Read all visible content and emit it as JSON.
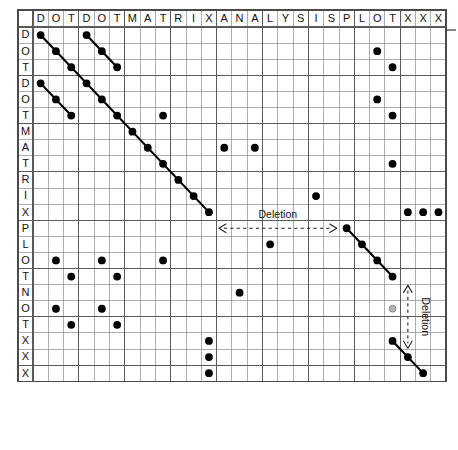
{
  "figure": {
    "grid": {
      "x0": 18,
      "y0": 10,
      "header_height": 17,
      "row_label_width": 15,
      "cell_w": 15.3,
      "cell_h": 16.1,
      "n_cols": 26,
      "n_rows": 24
    },
    "edge_tick": {
      "x1": 446,
      "x2": 456,
      "y": 30
    }
  },
  "colors": {
    "dot": "#000000",
    "dot_faded": "#b4b4b4",
    "grid_minor": "#8c8c8c",
    "grid_major": "#5a5a5a",
    "diagonal": "#000000",
    "text": "#101010"
  },
  "axes": {
    "column_sequence_label": "DOTDOTMATRIXANALYSISPLOTXXX",
    "row_sequence_label": "DOTDOTMATRIXPLOTNOTXXX",
    "columns": [
      "D",
      "O",
      "T",
      "D",
      "O",
      "T",
      "M",
      "A",
      "T",
      "R",
      "I",
      "X",
      "A",
      "N",
      "A",
      "L",
      "Y",
      "S",
      "I",
      "S",
      "P",
      "L",
      "O",
      "T",
      "X",
      "X",
      "X"
    ],
    "rows": [
      "D",
      "O",
      "T",
      "D",
      "O",
      "T",
      "M",
      "A",
      "T",
      "R",
      "I",
      "X",
      "P",
      "L",
      "O",
      "T",
      "N",
      "O",
      "T",
      "X",
      "X",
      "X"
    ]
  },
  "chart_data": {
    "type": "scatter",
    "xlabel": "",
    "ylabel": "",
    "x_categories": [
      "D",
      "O",
      "T",
      "D",
      "O",
      "T",
      "M",
      "A",
      "T",
      "R",
      "I",
      "X",
      "A",
      "N",
      "A",
      "L",
      "Y",
      "S",
      "I",
      "S",
      "P",
      "L",
      "O",
      "T",
      "X",
      "X",
      "X"
    ],
    "y_categories": [
      "D",
      "O",
      "T",
      "D",
      "O",
      "T",
      "M",
      "A",
      "T",
      "R",
      "I",
      "X",
      "P",
      "L",
      "O",
      "T",
      "N",
      "O",
      "T",
      "X",
      "X",
      "X"
    ],
    "grid": true,
    "legend": "none",
    "note": "Matches between row sequence and column sequence; col/row indices are 1-based",
    "points": [
      {
        "row": 1,
        "col": 1,
        "kind": "diagonal"
      },
      {
        "row": 2,
        "col": 2,
        "kind": "diagonal"
      },
      {
        "row": 3,
        "col": 3,
        "kind": "diagonal"
      },
      {
        "row": 4,
        "col": 4,
        "kind": "diagonal"
      },
      {
        "row": 5,
        "col": 5,
        "kind": "diagonal"
      },
      {
        "row": 6,
        "col": 6,
        "kind": "diagonal"
      },
      {
        "row": 7,
        "col": 7,
        "kind": "diagonal"
      },
      {
        "row": 8,
        "col": 8,
        "kind": "diagonal"
      },
      {
        "row": 9,
        "col": 9,
        "kind": "diagonal"
      },
      {
        "row": 10,
        "col": 10,
        "kind": "diagonal"
      },
      {
        "row": 11,
        "col": 11,
        "kind": "diagonal"
      },
      {
        "row": 12,
        "col": 12,
        "kind": "diagonal"
      },
      {
        "row": 1,
        "col": 4,
        "kind": "diagonal"
      },
      {
        "row": 2,
        "col": 5,
        "kind": "diagonal"
      },
      {
        "row": 3,
        "col": 6,
        "kind": "diagonal"
      },
      {
        "row": 4,
        "col": 1,
        "kind": "diagonal"
      },
      {
        "row": 5,
        "col": 2,
        "kind": "diagonal"
      },
      {
        "row": 6,
        "col": 3,
        "kind": "diagonal"
      },
      {
        "row": 13,
        "col": 21,
        "kind": "diagonal"
      },
      {
        "row": 14,
        "col": 22,
        "kind": "diagonal"
      },
      {
        "row": 15,
        "col": 23,
        "kind": "diagonal"
      },
      {
        "row": 16,
        "col": 24,
        "kind": "diagonal"
      },
      {
        "row": 20,
        "col": 24,
        "kind": "diagonal"
      },
      {
        "row": 21,
        "col": 25,
        "kind": "diagonal"
      },
      {
        "row": 22,
        "col": 26,
        "kind": "diagonal"
      },
      {
        "row": 2,
        "col": 23,
        "kind": "single"
      },
      {
        "row": 3,
        "col": 24,
        "kind": "single"
      },
      {
        "row": 5,
        "col": 23,
        "kind": "single"
      },
      {
        "row": 6,
        "col": 24,
        "kind": "single"
      },
      {
        "row": 6,
        "col": 9,
        "kind": "single"
      },
      {
        "row": 8,
        "col": 13,
        "kind": "single"
      },
      {
        "row": 8,
        "col": 15,
        "kind": "single"
      },
      {
        "row": 9,
        "col": 24,
        "kind": "single"
      },
      {
        "row": 11,
        "col": 19,
        "kind": "single"
      },
      {
        "row": 12,
        "col": 25,
        "kind": "single"
      },
      {
        "row": 12,
        "col": 26,
        "kind": "single"
      },
      {
        "row": 12,
        "col": 27,
        "kind": "single"
      },
      {
        "row": 14,
        "col": 16,
        "kind": "single"
      },
      {
        "row": 15,
        "col": 2,
        "kind": "single"
      },
      {
        "row": 15,
        "col": 5,
        "kind": "single"
      },
      {
        "row": 15,
        "col": 9,
        "kind": "single"
      },
      {
        "row": 16,
        "col": 3,
        "kind": "single"
      },
      {
        "row": 16,
        "col": 6,
        "kind": "single"
      },
      {
        "row": 17,
        "col": 14,
        "kind": "single"
      },
      {
        "row": 18,
        "col": 2,
        "kind": "single"
      },
      {
        "row": 18,
        "col": 5,
        "kind": "single"
      },
      {
        "row": 19,
        "col": 3,
        "kind": "single"
      },
      {
        "row": 19,
        "col": 6,
        "kind": "single"
      },
      {
        "row": 20,
        "col": 12,
        "kind": "single"
      },
      {
        "row": 21,
        "col": 12,
        "kind": "single"
      },
      {
        "row": 22,
        "col": 12,
        "kind": "single"
      },
      {
        "row": 18,
        "col": 24,
        "kind": "faded"
      }
    ],
    "diagonal_runs": [
      {
        "start_row": 1,
        "start_col": 1,
        "length": 12
      },
      {
        "start_row": 1,
        "start_col": 4,
        "length": 3
      },
      {
        "start_row": 4,
        "start_col": 1,
        "length": 3
      },
      {
        "start_row": 13,
        "start_col": 21,
        "length": 4
      },
      {
        "start_row": 20,
        "start_col": 24,
        "length": 3
      }
    ],
    "annotations": [
      {
        "id": "deletion-horizontal",
        "label": "Deletion",
        "orientation": "horizontal",
        "row": 13,
        "col_start": 13,
        "col_end": 20,
        "arrow": "double"
      },
      {
        "id": "deletion-vertical",
        "label": "Deletion",
        "orientation": "vertical",
        "col": 25,
        "row_start": 17,
        "row_end": 20,
        "arrow": "double"
      }
    ]
  },
  "annotations": {
    "deletion_horizontal_label": "Deletion",
    "deletion_vertical_label": "Deletion"
  }
}
